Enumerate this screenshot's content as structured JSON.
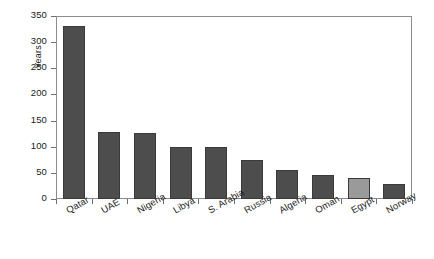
{
  "chart_data": {
    "type": "bar",
    "title": "",
    "xlabel": "",
    "ylabel": "Years",
    "ylim": [
      0,
      350
    ],
    "yticks": [
      0,
      50,
      100,
      150,
      200,
      250,
      300,
      350
    ],
    "grid": false,
    "legend": null,
    "categories": [
      "Qatar",
      "UAE",
      "Nigeria",
      "Libya",
      "S. Arabia",
      "Russia",
      "Algeria",
      "Oman",
      "Egypt",
      "Norway"
    ],
    "values": [
      330,
      128,
      127,
      100,
      99,
      75,
      55,
      46,
      41,
      28
    ],
    "bar_colors": [
      "#4d4d4d",
      "#4d4d4d",
      "#4d4d4d",
      "#4d4d4d",
      "#4d4d4d",
      "#4d4d4d",
      "#4d4d4d",
      "#4d4d4d",
      "#9a9a9a",
      "#4d4d4d"
    ],
    "highlight_category": "Egypt",
    "highlight_color": "#9a9a9a",
    "default_color": "#4d4d4d"
  }
}
